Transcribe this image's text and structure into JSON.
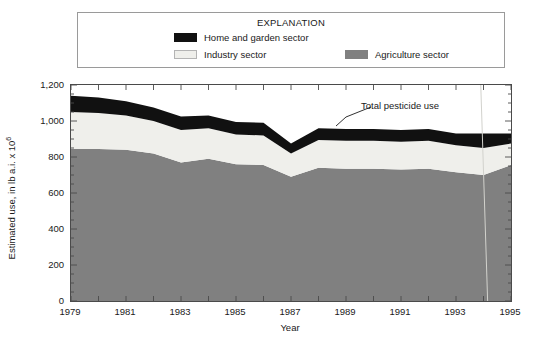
{
  "legend": {
    "title": "EXPLANATION",
    "entries": [
      {
        "label": "Home and garden sector",
        "color": "#111111",
        "swatch_name": "home-and-garden-swatch"
      },
      {
        "label": "Industry sector",
        "color": "#efefeb",
        "swatch_name": "industry-swatch"
      },
      {
        "label": "Agriculture sector",
        "color": "#808080",
        "swatch_name": "agriculture-swatch"
      }
    ]
  },
  "axes": {
    "y_title_main": "Estimated use, in lb a.i. x 10",
    "y_title_exponent": "6",
    "x_title": "Year",
    "y_ticks": [
      "0",
      "200",
      "400",
      "600",
      "800",
      "1,000",
      "1,200"
    ],
    "x_ticks": [
      "1979",
      "1981",
      "1983",
      "1985",
      "1987",
      "1989",
      "1991",
      "1993",
      "1995"
    ]
  },
  "annotation": {
    "total_label": "Total pesticide use"
  },
  "chart_data": {
    "type": "area",
    "title": "",
    "subtitle": "",
    "xlabel": "Year",
    "ylabel": "Estimated use, in lb a.i. x 10^6",
    "xlim": [
      1979,
      1995
    ],
    "ylim": [
      0,
      1200
    ],
    "ytick_interval": 200,
    "xtick_interval_labeled": 2,
    "xtick_interval_minor": 1,
    "grid": false,
    "stacked": true,
    "legend_position": "top",
    "annotations": [
      {
        "text": "Total pesticide use",
        "points_to": "top of stacked area near 1990",
        "x": 1990,
        "y": 990
      }
    ],
    "x": [
      1979,
      1980,
      1981,
      1982,
      1983,
      1984,
      1985,
      1986,
      1987,
      1988,
      1989,
      1990,
      1991,
      1992,
      1993,
      1994,
      1995
    ],
    "series": [
      {
        "name": "Agriculture sector",
        "color": "#808080",
        "values": [
          845,
          845,
          840,
          820,
          770,
          790,
          760,
          755,
          690,
          740,
          735,
          735,
          730,
          735,
          715,
          700,
          755
        ]
      },
      {
        "name": "Industry sector",
        "color": "#efefeb",
        "values": [
          205,
          200,
          190,
          180,
          180,
          170,
          165,
          165,
          130,
          155,
          155,
          155,
          155,
          155,
          150,
          150,
          120
        ]
      },
      {
        "name": "Home and garden sector",
        "color": "#111111",
        "values": [
          90,
          85,
          80,
          75,
          75,
          70,
          70,
          70,
          55,
          65,
          65,
          65,
          65,
          65,
          65,
          80,
          55
        ]
      }
    ],
    "totals": [
      1140,
      1130,
      1110,
      1075,
      1025,
      1030,
      995,
      990,
      875,
      960,
      955,
      955,
      950,
      955,
      930,
      930,
      930
    ]
  }
}
